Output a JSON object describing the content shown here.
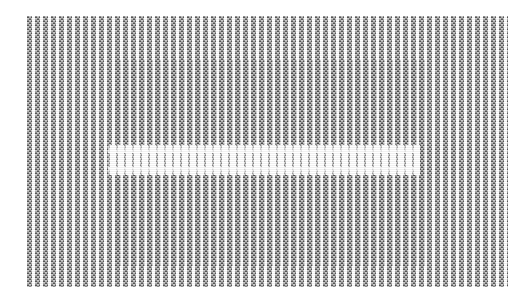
{
  "figure": {
    "media_type": "scanned-halftone-bitmap",
    "canvas": {
      "width": 532,
      "height": 305,
      "background_color": "#ffffff"
    },
    "content_block": {
      "label": "stripe-block",
      "left": 27,
      "top": 16,
      "width": 481,
      "height": 271,
      "background_color": "#ffffff"
    },
    "stripes": {
      "orientation": "vertical",
      "period_px": 8,
      "bar_width_px": 5,
      "gap_width_px": 3,
      "bar_color": "#5a5a5a",
      "bar_color_dark": "#404040",
      "gap_color": "#ffffff",
      "approx_bar_count": 60
    },
    "dither": {
      "pattern": "checkerboard-halftone",
      "cell_px": 4,
      "highlight_color": "#ffffff",
      "shadow_color": "#000000"
    },
    "dark_region": {
      "label": "central-dark-region",
      "left": 88,
      "top": 44,
      "width": 310,
      "height": 206,
      "tint_color": "#2e2e2e",
      "opacity": 0.34
    },
    "light_band": {
      "label": "central-light-band",
      "left": 81,
      "top": 129,
      "width": 312,
      "height": 30,
      "color": "#ffffff",
      "feather_px": 8
    },
    "tones": {
      "paper_white": "#ffffff",
      "light_gray": "#c8c8c8",
      "mid_gray": "#8a8a8a",
      "dark_gray": "#4a4a4a",
      "near_black": "#2b2b2b"
    }
  }
}
